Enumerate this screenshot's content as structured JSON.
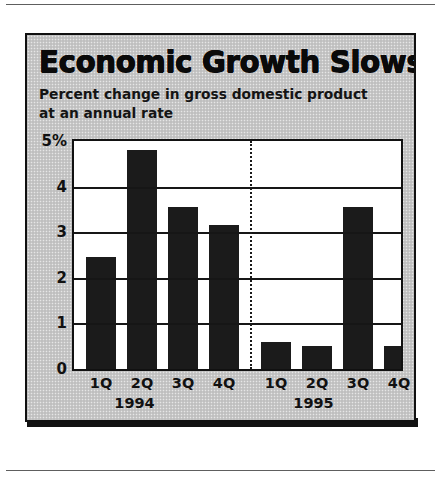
{
  "figure": {
    "title": "Economic Growth Slows",
    "subtitle": "Percent change in gross domestic product at an annual rate"
  },
  "chart_data": {
    "type": "bar",
    "title": "Economic Growth Slows",
    "subtitle": "Percent change in gross domestic product at an annual rate",
    "xlabel": "",
    "ylabel": "",
    "ylim": [
      0,
      5
    ],
    "yticks": [
      0,
      1,
      2,
      3,
      4,
      5
    ],
    "ytick_labels": [
      "0",
      "1",
      "2",
      "3",
      "4",
      "5%"
    ],
    "grid": true,
    "legend": "none",
    "bar_color": "#1b1b1b",
    "plot_background": "#ffffff",
    "panel_background": "#c8c8c8",
    "group_divider_after_index": 3,
    "categories": [
      "1Q",
      "2Q",
      "3Q",
      "4Q",
      "1Q",
      "2Q",
      "3Q",
      "4Q"
    ],
    "groups": [
      {
        "label": "1994",
        "categories": [
          "1Q",
          "2Q",
          "3Q",
          "4Q"
        ]
      },
      {
        "label": "1995",
        "categories": [
          "1Q",
          "2Q",
          "3Q",
          "4Q"
        ]
      }
    ],
    "values": [
      2.45,
      4.8,
      3.55,
      3.15,
      0.6,
      0.5,
      3.55,
      0.5
    ],
    "points": [
      {
        "year": "1994",
        "quarter": "1Q",
        "value": 2.45
      },
      {
        "year": "1994",
        "quarter": "2Q",
        "value": 4.8
      },
      {
        "year": "1994",
        "quarter": "3Q",
        "value": 3.55
      },
      {
        "year": "1994",
        "quarter": "4Q",
        "value": 3.15
      },
      {
        "year": "1995",
        "quarter": "1Q",
        "value": 0.6
      },
      {
        "year": "1995",
        "quarter": "2Q",
        "value": 0.5
      },
      {
        "year": "1995",
        "quarter": "3Q",
        "value": 3.55
      },
      {
        "year": "1995",
        "quarter": "4Q",
        "value": 0.5
      }
    ]
  }
}
